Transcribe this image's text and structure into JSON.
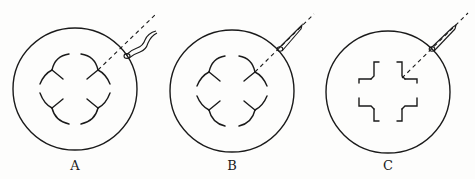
{
  "figure": {
    "type": "diagram",
    "panels": [
      {
        "label": "A",
        "pattern": "curved-petal arcs (wavy pipette)"
      },
      {
        "label": "B",
        "pattern": "curved-petal arcs (straight pipette)"
      },
      {
        "label": "C",
        "pattern": "angular bracket cross"
      }
    ]
  }
}
